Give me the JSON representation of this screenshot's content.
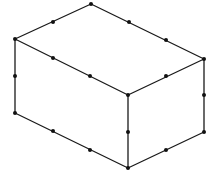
{
  "figure": {
    "width": 216,
    "height": 179,
    "stroke_color": "#1a1a1a",
    "dot_color": "#111111",
    "background": "#ffffff"
  },
  "vertices": {
    "top_back": [
      91,
      4
    ],
    "top_left": [
      15,
      39
    ],
    "top_right": [
      204,
      59
    ],
    "top_front": [
      128,
      95
    ],
    "bottom_left": [
      15,
      113
    ],
    "bottom_front": [
      128,
      168
    ],
    "bottom_right": [
      204,
      132
    ]
  },
  "edges": [
    {
      "name": "top-back-left-edge",
      "from": "top_back",
      "to": "top_left"
    },
    {
      "name": "top-back-right-edge",
      "from": "top_back",
      "to": "top_right"
    },
    {
      "name": "top-left-front-edge",
      "from": "top_left",
      "to": "top_front"
    },
    {
      "name": "top-front-right-edge",
      "from": "top_front",
      "to": "top_right"
    },
    {
      "name": "left-vertical-edge",
      "from": "top_left",
      "to": "bottom_left"
    },
    {
      "name": "front-vertical-edge",
      "from": "top_front",
      "to": "bottom_front"
    },
    {
      "name": "right-vertical-edge",
      "from": "top_right",
      "to": "bottom_right"
    },
    {
      "name": "bottom-left-front-edge",
      "from": "bottom_left",
      "to": "bottom_front"
    },
    {
      "name": "bottom-front-right-edge",
      "from": "bottom_front",
      "to": "bottom_right"
    }
  ],
  "division_points": [
    {
      "edge": "top-back-left-edge",
      "point": [
        53,
        22
      ]
    },
    {
      "edge": "top-back-right-edge",
      "point": [
        129,
        22
      ]
    },
    {
      "edge": "top-back-right-edge",
      "point": [
        166,
        40
      ]
    },
    {
      "edge": "top-left-front-edge",
      "point": [
        53,
        58
      ]
    },
    {
      "edge": "top-left-front-edge",
      "point": [
        90,
        76
      ]
    },
    {
      "edge": "top-front-right-edge",
      "point": [
        166,
        76
      ]
    },
    {
      "edge": "left-vertical-edge",
      "point": [
        15,
        76
      ]
    },
    {
      "edge": "right-vertical-edge",
      "point": [
        204,
        95
      ]
    },
    {
      "edge": "front-vertical-edge",
      "point": [
        128,
        132
      ]
    },
    {
      "edge": "bottom-left-front-edge",
      "point": [
        53,
        131
      ]
    },
    {
      "edge": "bottom-left-front-edge",
      "point": [
        90,
        150
      ]
    },
    {
      "edge": "bottom-front-right-edge",
      "point": [
        166,
        150
      ]
    }
  ],
  "dot_radius": 2
}
